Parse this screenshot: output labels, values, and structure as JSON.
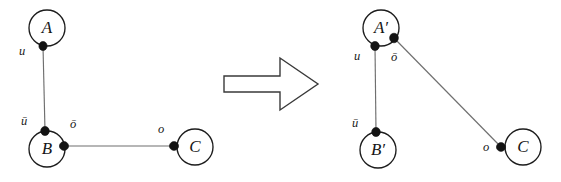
{
  "figure": {
    "type": "graph-rewrite-diagram",
    "background_color": "#ffffff",
    "node_stroke_color": "#1c1c1c",
    "edge_color": "#6f6f6f",
    "port_color": "#131313",
    "arrow_stroke_color": "#3a3a3a"
  },
  "left_graph": {
    "name": "left-hand-side",
    "nodes": [
      {
        "id": "A",
        "label": "A",
        "cx": 47,
        "cy": 28,
        "r": 18
      },
      {
        "id": "B",
        "label": "B",
        "cx": 47,
        "cy": 149,
        "r": 18
      },
      {
        "id": "C",
        "label": "C",
        "cx": 195,
        "cy": 147,
        "r": 18
      }
    ],
    "ports": [
      {
        "id": "A-u",
        "label": "u",
        "cx": 43,
        "cy": 46,
        "label_x": 22,
        "label_y": 52
      },
      {
        "id": "B-ubar",
        "label": "ū",
        "cx": 45,
        "cy": 131,
        "label_x": 24,
        "label_y": 122
      },
      {
        "id": "B-obar",
        "label": "ō",
        "cx": 64,
        "cy": 146,
        "label_x": 73,
        "label_y": 125
      },
      {
        "id": "C-o",
        "label": "o",
        "cx": 174,
        "cy": 146,
        "label_x": 161,
        "label_y": 130
      }
    ],
    "edges": [
      {
        "id": "A-u--B-ubar",
        "from": "A-u",
        "to": "B-ubar",
        "x1": 43,
        "y1": 46,
        "x2": 45,
        "y2": 131
      },
      {
        "id": "B-obar--C-o",
        "from": "B-obar",
        "to": "C-o",
        "x1": 64,
        "y1": 146,
        "x2": 174,
        "y2": 146
      }
    ]
  },
  "arrow": {
    "name": "rewrite-arrow",
    "direction": "right",
    "points": "224,76 280,76 280,58 318,84 280,110 280,92 224,92"
  },
  "right_graph": {
    "name": "right-hand-side",
    "nodes": [
      {
        "id": "Aprime",
        "label": "A′",
        "cx": 381,
        "cy": 28,
        "r": 18
      },
      {
        "id": "Bprime",
        "label": "B′",
        "cx": 378,
        "cy": 150,
        "r": 18
      },
      {
        "id": "C2",
        "label": "C",
        "cx": 523,
        "cy": 147,
        "r": 18
      }
    ],
    "ports": [
      {
        "id": "Ap-u",
        "label": "u",
        "cx": 375,
        "cy": 46,
        "label_x": 357,
        "label_y": 57
      },
      {
        "id": "Ap-obar",
        "label": "ō",
        "cx": 394,
        "cy": 38,
        "label_x": 394,
        "label_y": 58
      },
      {
        "id": "Bp-ubar",
        "label": "ū",
        "cx": 376,
        "cy": 132,
        "label_x": 355,
        "label_y": 124
      },
      {
        "id": "C2-o",
        "label": "o",
        "cx": 501,
        "cy": 147,
        "label_x": 486,
        "label_y": 148
      }
    ],
    "edges": [
      {
        "id": "Ap-u--Bp-ubar",
        "from": "Ap-u",
        "to": "Bp-ubar",
        "x1": 375,
        "y1": 46,
        "x2": 376,
        "y2": 132
      },
      {
        "id": "Ap-obar--C2-o",
        "from": "Ap-obar",
        "to": "C2-o",
        "x1": 394,
        "y1": 38,
        "x2": 501,
        "y2": 147
      }
    ]
  }
}
